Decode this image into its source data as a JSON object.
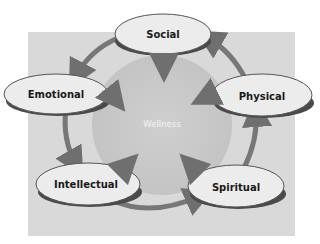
{
  "diagram": {
    "type": "cycle",
    "center": {
      "label": "Wellness"
    },
    "nodes": [
      {
        "id": "social",
        "label": "Social"
      },
      {
        "id": "physical",
        "label": "Physical"
      },
      {
        "id": "spiritual",
        "label": "Spiritual"
      },
      {
        "id": "intellectual",
        "label": "Intellectual"
      },
      {
        "id": "emotional",
        "label": "Emotional"
      }
    ],
    "cycle_edges": [
      {
        "from": "social",
        "to": "emotional"
      },
      {
        "from": "emotional",
        "to": "intellectual"
      },
      {
        "from": "intellectual",
        "to": "spiritual"
      },
      {
        "from": "spiritual",
        "to": "physical"
      },
      {
        "from": "physical",
        "to": "social"
      }
    ],
    "center_edges": [
      {
        "from": "social",
        "to": "wellness"
      },
      {
        "from": "emotional",
        "to": "wellness"
      },
      {
        "from": "intellectual",
        "to": "wellness"
      },
      {
        "from": "spiritual",
        "to": "wellness"
      },
      {
        "from": "physical",
        "to": "wellness"
      }
    ],
    "colors": {
      "background_panel": "#d9d9d9",
      "center_circle": "#c9c9c9",
      "node_fill": "#ececec",
      "node_shadow": "#555555",
      "arrow": "#7a7a7a",
      "center_text": "#f4f4f4"
    }
  }
}
